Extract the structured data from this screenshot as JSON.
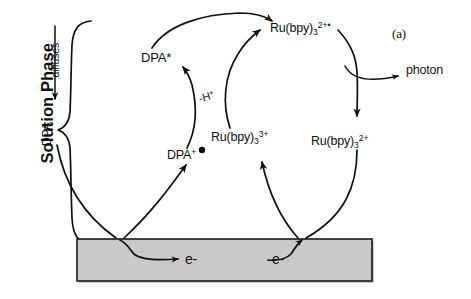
{
  "figure": {
    "panel_label": "(a)",
    "title_rotated": "Solution Phase"
  },
  "labels": {
    "solution_phase": "Solution Phase",
    "diffuses": "diffuses",
    "dpa": "DPA",
    "dpa_excited": "DPA*",
    "dpa_radical_cation_base": "DPA",
    "dpa_radical_cation_charge": "+",
    "proton_loss": "-H",
    "proton_loss_charge": "+",
    "ru_base": "Ru(bpy)",
    "ru_sub": "3",
    "ru_excited_charge": "2+",
    "ru_excited_radical": "•",
    "ru_oxidized_charge": "3+",
    "ru_ground_charge": "2+",
    "photon": "photon",
    "electron_left": "e-",
    "electron_right": "e-"
  },
  "colors": {
    "ink": "#111111",
    "electrode_fill": "#c9c9c9",
    "electrode_stroke": "#1a1a1a",
    "background": "#ffffff"
  },
  "electrode": {
    "name": "electrode",
    "x": 77,
    "y": 239,
    "width": 295,
    "height": 42
  }
}
